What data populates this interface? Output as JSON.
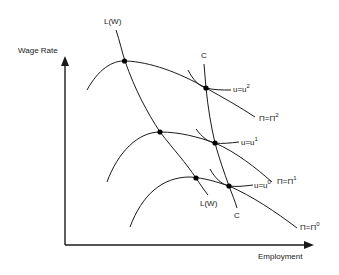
{
  "diagram": {
    "axes": {
      "y_label": "Wage Rate",
      "x_label": "Employment"
    },
    "labour_demand": {
      "label_top": "L(W)",
      "label_bottom": "L(W)"
    },
    "contract_curve": {
      "label_top": "C",
      "label_bottom": "C"
    },
    "isoprofit_curves": [
      {
        "label": "Π=Π",
        "superscript": "2"
      },
      {
        "label": "Π=Π",
        "superscript": "1"
      },
      {
        "label": "Π=Π",
        "superscript": "0"
      }
    ],
    "indifference_curves": [
      {
        "label": "u=u",
        "superscript": "2"
      },
      {
        "label": "u=u",
        "superscript": "1"
      },
      {
        "label": "u=u",
        "superscript": "0"
      }
    ],
    "colors": {
      "line": "#1a1a1a",
      "background": "#ffffff"
    }
  }
}
